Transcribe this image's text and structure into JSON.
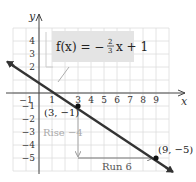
{
  "chart_data": {
    "type": "line",
    "title": "",
    "equation": "f(x) = -2/3 x + 1",
    "equation_parts": {
      "lhs": "f(x) = −",
      "num": "2",
      "den": "3",
      "rhs": "x + 1"
    },
    "xlabel": "x",
    "ylabel": "y",
    "xlim": [
      -2,
      10
    ],
    "ylim": [
      -6,
      5
    ],
    "grid": true,
    "x_ticks": [
      "-1",
      "1",
      "3",
      "4",
      "5",
      "6",
      "7",
      "8",
      "9"
    ],
    "x_tick_values": [
      -1,
      1,
      3,
      4,
      5,
      6,
      7,
      8,
      9
    ],
    "y_ticks": [
      "4",
      "3",
      "2",
      "-1",
      "-2",
      "-3",
      "-4",
      "-5"
    ],
    "y_tick_values": [
      4,
      3,
      2,
      -1,
      -2,
      -3,
      -4,
      -5
    ],
    "series": [
      {
        "name": "f(x) = -2/3 x + 1",
        "slope": -0.6667,
        "intercept": 1,
        "x": [
          -2,
          10
        ],
        "y": [
          2.333,
          -5.667
        ],
        "color": "#333333"
      }
    ],
    "points": [
      {
        "x": 3,
        "y": -1,
        "label": "(3, −1)"
      },
      {
        "x": 9,
        "y": -5,
        "label": "(9, −5)"
      }
    ],
    "annotations": {
      "rise": {
        "label": "Rise −4",
        "from": [
          3,
          -1
        ],
        "to": [
          3,
          -5
        ]
      },
      "run": {
        "label": "Run 6",
        "from": [
          3,
          -5
        ],
        "to": [
          9,
          -5
        ]
      }
    },
    "colors": {
      "line": "#333333",
      "grid": "#dddddd",
      "axis": "#444444",
      "rise_arrow": "#aaaaaa",
      "run_arrow": "#777777",
      "equation_box": "#e4e4e4"
    }
  }
}
